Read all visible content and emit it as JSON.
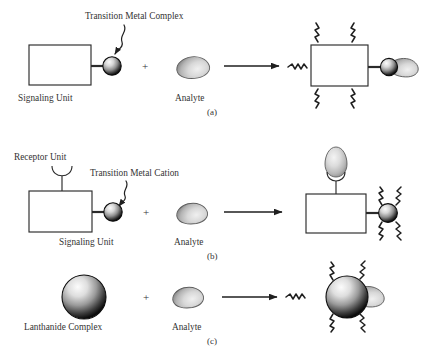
{
  "figure": {
    "background_color": "#ffffff",
    "ink_color": "#2b2b2b",
    "text_color": "#333333",
    "sphere_colors": {
      "highlight": "#f2f2f2",
      "mid": "#8d8d8d",
      "edge": "#121212"
    },
    "analyte_colors": {
      "highlight": "#e8e8e8",
      "mid": "#c2c2c2",
      "edge": "#8a8a8a"
    },
    "panels": [
      {
        "id": "a",
        "panel_label": "(a)",
        "callout_label": "Transition Metal Complex",
        "reactant_labels": [
          "Signaling Unit",
          "Analyte"
        ],
        "operator": "+",
        "reaction_arrow": "→",
        "emission_rays": 4,
        "excitation_ray": 1,
        "has_receptor_unit": false,
        "product_description": "Signaling unit box with bound analyte on metal sphere, emitting light"
      },
      {
        "id": "b",
        "panel_label": "(b)",
        "callout_label": "Transition Metal Cation",
        "receptor_label": "Receptor Unit",
        "reactant_labels": [
          "Signaling Unit",
          "Analyte"
        ],
        "operator": "+",
        "reaction_arrow": "→",
        "emission_rays": 4,
        "excitation_ray": 0,
        "has_receptor_unit": true,
        "product_description": "Analyte captured in receptor cup, metal cation sphere emitting light"
      },
      {
        "id": "c",
        "panel_label": "(c)",
        "reactant_labels": [
          "Lanthanide Complex",
          "Analyte"
        ],
        "operator": "+",
        "reaction_arrow": "→",
        "emission_rays": 4,
        "excitation_ray": 1,
        "has_receptor_unit": false,
        "product_description": "Large lanthanide sphere with bound analyte, emitting light"
      }
    ],
    "labels": {
      "transition_metal_complex": "Transition Metal Complex",
      "transition_metal_cation": "Transition Metal Cation",
      "receptor_unit": "Receptor Unit",
      "signaling_unit": "Signaling Unit",
      "analyte": "Analyte",
      "lanthanide_complex": "Lanthanide Complex",
      "panel_a": "(a)",
      "panel_b": "(b)",
      "panel_c": "(c)",
      "plus": "+"
    }
  }
}
